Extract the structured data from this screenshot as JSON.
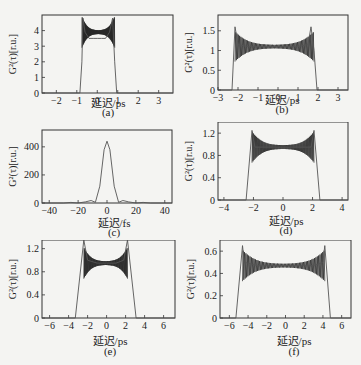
{
  "figure": {
    "ylabel": "G²(τ)[r.u.]",
    "panels": [
      {
        "id": "a",
        "caption": "(a)",
        "xlabel": "延迟/ps"
      },
      {
        "id": "b",
        "caption": "(b)",
        "xlabel": "延迟/ps"
      },
      {
        "id": "c",
        "caption": "(c)",
        "xlabel": "延迟/fs"
      },
      {
        "id": "d",
        "caption": "(d)",
        "xlabel": "延迟/ps"
      },
      {
        "id": "e",
        "caption": "(e)",
        "xlabel": "延迟/ps"
      },
      {
        "id": "f",
        "caption": "(f)",
        "xlabel": "延迟/ps"
      }
    ]
  },
  "chart_data": [
    {
      "id": "a",
      "type": "line",
      "title": "",
      "xlabel": "延迟/ps",
      "ylabel": "G²(τ)[r.u.]",
      "xlim": [
        -2.7,
        3.7
      ],
      "ylim": [
        0,
        5
      ],
      "xticks": [
        -2,
        -1,
        0,
        1,
        2,
        3
      ],
      "yticks": [
        0,
        1,
        2,
        3,
        4
      ],
      "x": [
        -2.7,
        -0.85,
        -0.75,
        -0.7,
        -0.6,
        -0.4,
        -0.2,
        0,
        0.2,
        0.4,
        0.6,
        0.75,
        0.85,
        0.95,
        3.7
      ],
      "values": [
        0,
        0,
        2,
        4.8,
        3.9,
        3.5,
        3.5,
        3.5,
        3.5,
        3.5,
        3.9,
        4.8,
        2,
        0,
        0
      ],
      "note": "Flat-top intensity autocorrelation with dense oscillations (≈2.9–4.2) between edges at ±0.75 ps; edge peaks ≈4.8"
    },
    {
      "id": "b",
      "type": "line",
      "title": "",
      "xlabel": "延迟/ps",
      "ylabel": "G²(τ)[r.u.]",
      "xlim": [
        -3,
        3.5
      ],
      "ylim": [
        0,
        1.9
      ],
      "xticks": [
        -3,
        -2,
        -1,
        0,
        1,
        2,
        3
      ],
      "yticks": [
        0,
        0.5,
        1.0,
        1.5
      ],
      "x": [
        -3,
        -2.3,
        -2.15,
        -2.0,
        -1.5,
        -1,
        0,
        1,
        1.5,
        1.65,
        1.8,
        1.95,
        3.5
      ],
      "values": [
        0,
        0,
        1.6,
        1.15,
        1.1,
        1.1,
        1.1,
        1.1,
        1.15,
        1.6,
        1.0,
        0,
        0
      ],
      "note": "Plateau ≈1.1 from -2.15 to 1.65 ps with oscillation envelope widening near edges; edge peaks ≈1.6"
    },
    {
      "id": "c",
      "type": "line",
      "title": "",
      "xlabel": "延迟/fs",
      "ylabel": "G²(τ)[r.u.]",
      "xlim": [
        -45,
        45
      ],
      "ylim": [
        0,
        520
      ],
      "xticks": [
        -40,
        -20,
        0,
        20,
        40
      ],
      "yticks": [
        0,
        200,
        400
      ],
      "x": [
        -45,
        -30,
        -25,
        -20,
        -15,
        -11,
        -8,
        -5,
        -2,
        0,
        2,
        5,
        8,
        11,
        15,
        20,
        25,
        30,
        45
      ],
      "values": [
        0,
        0,
        4,
        0,
        8,
        18,
        5,
        120,
        380,
        440,
        380,
        120,
        5,
        18,
        8,
        0,
        4,
        0,
        0
      ],
      "note": "Single sinc²-like peak ≈440 at 0 fs with small side lobes"
    },
    {
      "id": "d",
      "type": "line",
      "title": "",
      "xlabel": "延迟/ps",
      "ylabel": "G²(τ)[r.u.]",
      "xlim": [
        -4.4,
        4.4
      ],
      "ylim": [
        0,
        1.4
      ],
      "xticks": [
        -4,
        -2,
        0,
        2,
        4
      ],
      "yticks": [
        0,
        0.4,
        0.8,
        1.2
      ],
      "x": [
        -4.4,
        -2.5,
        -2.1,
        -1.9,
        -1,
        0,
        1,
        1.9,
        2.1,
        2.5,
        4.4
      ],
      "values": [
        0,
        0,
        1.25,
        0.95,
        0.95,
        0.95,
        0.95,
        0.95,
        1.25,
        0,
        0
      ],
      "note": "Plateau ≈0.95 between ±2 ps, oscillation envelope 0.8–1.1, edge peaks ≈1.25"
    },
    {
      "id": "e",
      "type": "line",
      "title": "",
      "xlabel": "延迟/ps",
      "ylabel": "G²(τ)[r.u.]",
      "xlim": [
        -6.8,
        7.2
      ],
      "ylim": [
        0,
        1.35
      ],
      "xticks": [
        -6,
        -4,
        -2,
        0,
        2,
        4,
        6
      ],
      "yticks": [
        0,
        0.4,
        0.8,
        1.2
      ],
      "x": [
        -6.8,
        -3.3,
        -2.4,
        -2.0,
        -1,
        0,
        1,
        1.8,
        2.2,
        3.1,
        7.2
      ],
      "values": [
        0,
        0,
        1.35,
        1.0,
        0.95,
        0.95,
        0.95,
        1.0,
        1.35,
        0,
        0
      ],
      "note": "Plateau ≈0.95 from -2.4 to 2.2 ps with dense oscillations (0.7–1.2); edges exceed 1.3"
    },
    {
      "id": "f",
      "type": "line",
      "title": "",
      "xlabel": "延迟/ps",
      "ylabel": "G²(τ)[r.u.]",
      "xlim": [
        -7,
        7
      ],
      "ylim": [
        0,
        0.7
      ],
      "xticks": [
        -6,
        -4,
        -2,
        0,
        2,
        4,
        6
      ],
      "yticks": [
        0,
        0.2,
        0.4,
        0.6
      ],
      "x": [
        -7,
        -5.3,
        -4.6,
        -4.4,
        -3,
        -1,
        0,
        1,
        3,
        4.0,
        4.2,
        4.8,
        7
      ],
      "values": [
        0,
        0,
        0.65,
        0.5,
        0.47,
        0.47,
        0.47,
        0.47,
        0.47,
        0.5,
        0.65,
        0,
        0
      ],
      "note": "Plateau ≈0.47 from -4.5 to 4.2 ps with oscillations 0.35–0.6; edge peaks ≈0.65"
    }
  ]
}
